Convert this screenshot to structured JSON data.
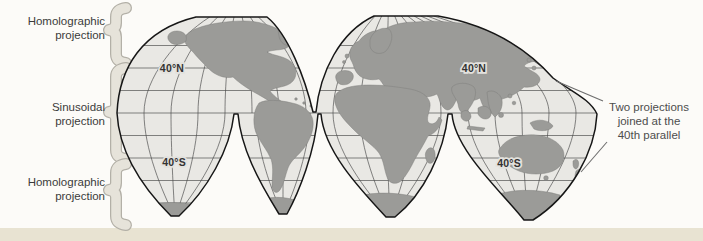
{
  "left_labels": {
    "top": {
      "line1": "Homolographic",
      "line2": "projection"
    },
    "middle": {
      "line1": "Sinusoidal",
      "line2": "projection"
    },
    "bottom": {
      "line1": "Homolographic",
      "line2": "projection"
    }
  },
  "parallel_labels": {
    "north_west": "40°N",
    "north_east": "40°N",
    "south_west": "40°S",
    "south_east": "40°S"
  },
  "annotation": {
    "line1": "Two projections",
    "line2": "joined at the",
    "line3": "40th parallel"
  },
  "colors": {
    "land": "#9b9b98",
    "ocean": "#e9e8e4",
    "map_outline": "#161616",
    "graticule": "#4c4c4c",
    "brace_fill": "#e6e3da",
    "brace_edge": "#b3b0a7",
    "label_text": "#3b3b3b",
    "annotation_text": "#4d4d4d",
    "page_background": "#fcfbf8",
    "page_strip": "#e8e3d2"
  }
}
